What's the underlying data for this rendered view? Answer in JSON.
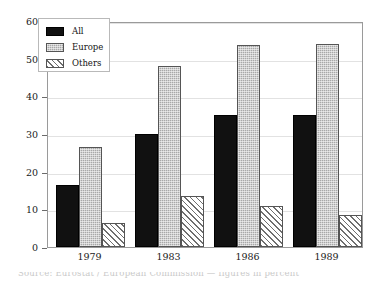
{
  "chart_data": {
    "type": "bar",
    "title": "",
    "subtitle": "",
    "xlabel": "",
    "ylabel": "",
    "categories": [
      "1979",
      "1983",
      "1986",
      "1989"
    ],
    "series": [
      {
        "name": "All",
        "values": [
          16.5,
          30.0,
          35.0,
          35.0
        ],
        "color": "#111111",
        "fill": "solid"
      },
      {
        "name": "Europe",
        "values": [
          26.5,
          48.0,
          53.5,
          54.0
        ],
        "color": "#a8a8a8",
        "fill": "stipple"
      },
      {
        "name": "Others",
        "values": [
          6.3,
          13.5,
          11.0,
          8.6
        ],
        "color": "#ffffff",
        "fill": "diagonal-hatch"
      }
    ],
    "ylim": [
      0,
      60
    ],
    "yticks": [
      0,
      10,
      20,
      30,
      40,
      50,
      60
    ],
    "ytick_labels": [
      "0",
      "10",
      "20",
      "30",
      "40",
      "50",
      "60"
    ],
    "grid": true,
    "legend_position": "upper-left",
    "frame": true
  },
  "legend": {
    "entries": [
      {
        "label": "All",
        "swatch": "solid-black-swatch"
      },
      {
        "label": "Europe",
        "swatch": "gray-stipple-swatch"
      },
      {
        "label": "Others",
        "swatch": "diagonal-hatch-swatch"
      }
    ]
  },
  "caption": {
    "clipped_text": "Source: Eurostat / European Commission — figures in percent"
  }
}
